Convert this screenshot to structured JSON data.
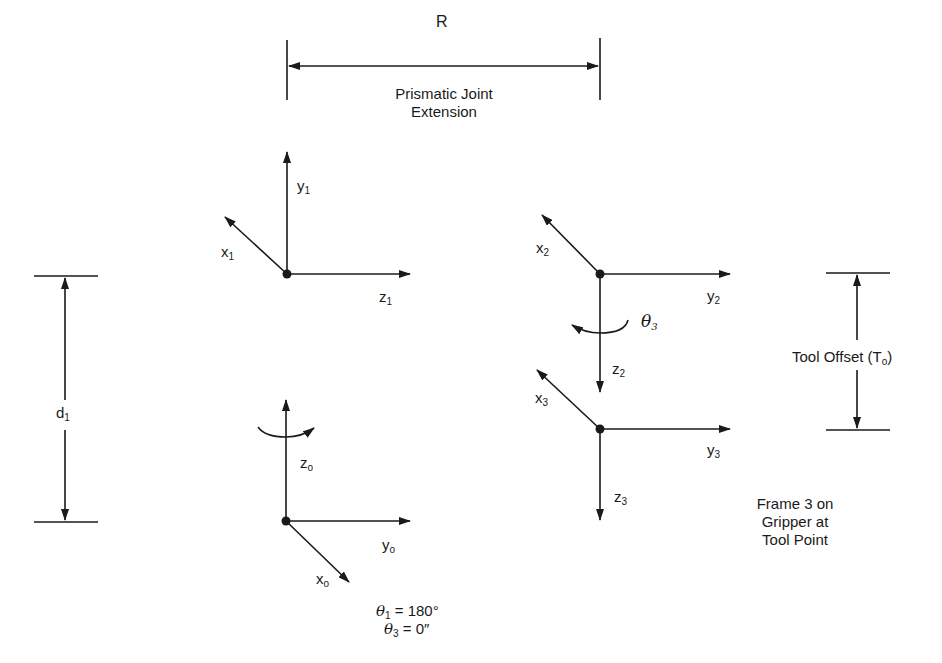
{
  "diagram": {
    "dimensions": {
      "R": {
        "label": "R",
        "caption_line1": "Prismatic Joint",
        "caption_line2": "Extension"
      },
      "d1": {
        "label": "d",
        "sub": "1"
      },
      "tool_offset": {
        "label": "Tool Offset (T",
        "sub": "o",
        "close": ")"
      }
    },
    "frames": {
      "frame0": {
        "x": "x",
        "x_sub": "o",
        "y": "y",
        "y_sub": "o",
        "z": "z",
        "z_sub": "o"
      },
      "frame1": {
        "x": "x",
        "x_sub": "1",
        "y": "y",
        "y_sub": "1",
        "z": "z",
        "z_sub": "1"
      },
      "frame2": {
        "x": "x",
        "x_sub": "2",
        "y": "y",
        "y_sub": "2",
        "z": "z",
        "z_sub": "2",
        "theta": "θ",
        "theta_sub": "3"
      },
      "frame3": {
        "x": "x",
        "x_sub": "3",
        "y": "y",
        "y_sub": "3",
        "z": "z",
        "z_sub": "3"
      }
    },
    "note": {
      "line1": "Frame 3 on",
      "line2": "Gripper at",
      "line3": "Tool Point"
    },
    "angles": {
      "theta1": {
        "symbol": "θ",
        "sub": "1",
        "value": " = 180°"
      },
      "theta3": {
        "symbol": "θ",
        "sub": "3",
        "value": " = 0″"
      }
    },
    "colors": {
      "ink": "#1a1a1a",
      "background": "#ffffff"
    }
  }
}
